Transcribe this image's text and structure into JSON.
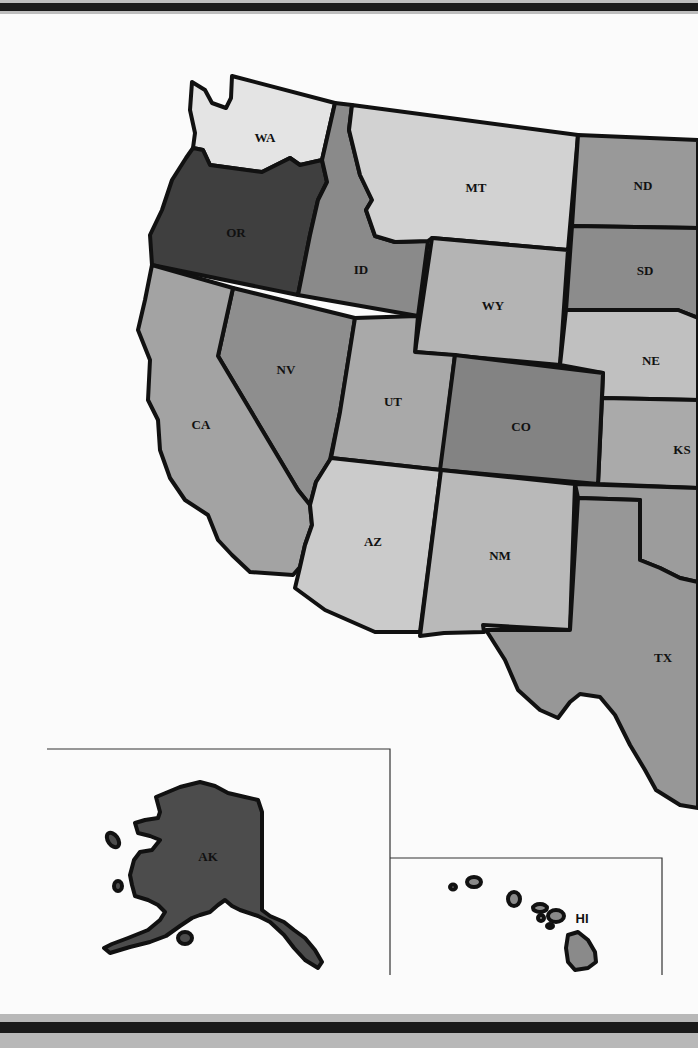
{
  "map": {
    "title": "",
    "states": [
      {
        "abbr": "WA",
        "fill": "#e4e4e4",
        "label_x": 265,
        "label_y": 139
      },
      {
        "abbr": "OR",
        "fill": "#3f3f3f",
        "label_x": 236,
        "label_y": 234
      },
      {
        "abbr": "ID",
        "fill": "#8a8a8a",
        "label_x": 360,
        "label_y": 270
      },
      {
        "abbr": "MT",
        "fill": "#d2d2d2",
        "label_x": 476,
        "label_y": 188
      },
      {
        "abbr": "ND",
        "fill": "#999999",
        "label_x": 643,
        "label_y": 186
      },
      {
        "abbr": "SD",
        "fill": "#8c8c8c",
        "label_x": 644,
        "label_y": 272
      },
      {
        "abbr": "WY",
        "fill": "#b4b4b4",
        "label_x": 493,
        "label_y": 306
      },
      {
        "abbr": "NE",
        "fill": "#c0c0c0",
        "label_x": 651,
        "label_y": 362
      },
      {
        "abbr": "NV",
        "fill": "#8e8e8e",
        "label_x": 286,
        "label_y": 370
      },
      {
        "abbr": "UT",
        "fill": "#a9a9a9",
        "label_x": 394,
        "label_y": 402
      },
      {
        "abbr": "CO",
        "fill": "#838383",
        "label_x": 521,
        "label_y": 427
      },
      {
        "abbr": "KS",
        "fill": "#aaaaaa",
        "label_x": 681,
        "label_y": 451
      },
      {
        "abbr": "CA",
        "fill": "#a3a3a3",
        "label_x": 201,
        "label_y": 425
      },
      {
        "abbr": "AZ",
        "fill": "#cbcbcb",
        "label_x": 372,
        "label_y": 543
      },
      {
        "abbr": "NM",
        "fill": "#b9b9b9",
        "label_x": 500,
        "label_y": 557
      },
      {
        "abbr": "OK",
        "fill": "#9c9c9c",
        "label_x": 0,
        "label_y": 0
      },
      {
        "abbr": "TX",
        "fill": "#979797",
        "label_x": 663,
        "label_y": 659
      },
      {
        "abbr": "AK",
        "fill": "#4c4c4c",
        "label_x": 208,
        "label_y": 857
      },
      {
        "abbr": "HI",
        "fill": "#8a8a8a",
        "label_x": 582,
        "label_y": 920
      }
    ],
    "labels": {
      "WA": "WA",
      "OR": "OR",
      "ID": "ID",
      "MT": "MT",
      "ND": "ND",
      "SD": "SD",
      "WY": "WY",
      "NE": "NE",
      "NV": "NV",
      "UT": "UT",
      "CO": "CO",
      "KS": "KS",
      "CA": "CA",
      "AZ": "AZ",
      "NM": "NM",
      "TX": "TX",
      "AK": "AK",
      "HI": "HI"
    },
    "insets": [
      {
        "name": "Alaska inset",
        "state": "AK"
      },
      {
        "name": "Hawaii inset",
        "state": "HI"
      }
    ]
  }
}
